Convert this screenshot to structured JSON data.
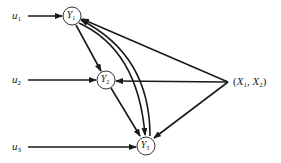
{
  "diagram": {
    "type": "path-diagram",
    "inputs": [
      {
        "id": "u1",
        "base": "u",
        "sub": "1"
      },
      {
        "id": "u2",
        "base": "u",
        "sub": "2"
      },
      {
        "id": "u3",
        "base": "u",
        "sub": "3"
      }
    ],
    "nodes": [
      {
        "id": "Y1",
        "base": "Y",
        "sub": "1"
      },
      {
        "id": "Y2",
        "base": "Y",
        "sub": "2"
      },
      {
        "id": "Y3",
        "base": "Y",
        "sub": "3"
      }
    ],
    "exogenous": {
      "id": "X",
      "open": "(",
      "x1_base": "X",
      "x1_sub": "1",
      "sep": ", ",
      "x2_base": "X",
      "x2_sub": "2",
      "close": ")"
    },
    "edges": [
      {
        "from": "u1",
        "to": "Y1"
      },
      {
        "from": "u2",
        "to": "Y2"
      },
      {
        "from": "u3",
        "to": "Y3"
      },
      {
        "from": "Y1",
        "to": "Y2"
      },
      {
        "from": "Y1",
        "to": "Y3",
        "curved": true
      },
      {
        "from": "Y3",
        "to": "Y1",
        "curved": true
      },
      {
        "from": "Y2",
        "to": "Y3"
      },
      {
        "from": "X",
        "to": "Y1"
      },
      {
        "from": "X",
        "to": "Y2"
      },
      {
        "from": "X",
        "to": "Y3"
      }
    ],
    "stroke_color": "#1a1a1a"
  }
}
